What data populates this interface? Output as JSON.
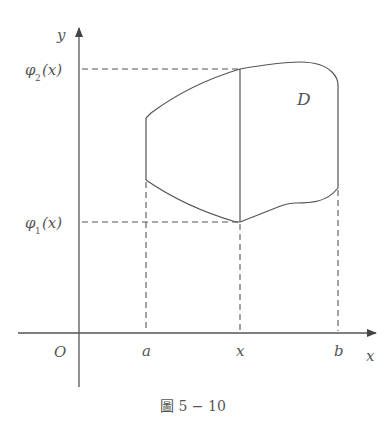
{
  "diagram": {
    "type": "double-integral-region",
    "axes": {
      "x_label": "x",
      "y_label": "y",
      "origin_label": "O"
    },
    "y_ticks": [
      {
        "label_main": "φ",
        "label_sub": "2",
        "label_arg": "(x)"
      },
      {
        "label_main": "φ",
        "label_sub": "1",
        "label_arg": "(x)"
      }
    ],
    "x_ticks": [
      {
        "label": "a"
      },
      {
        "label": "x"
      },
      {
        "label": "b"
      }
    ],
    "region_label": "D",
    "caption": "圖 5 − 10",
    "colors": {
      "line": "#555555",
      "text": "#555555",
      "background": "#ffffff"
    }
  }
}
